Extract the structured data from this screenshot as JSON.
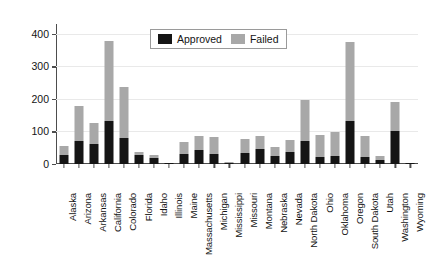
{
  "chart_data": {
    "type": "bar",
    "subtype": "stacked-vertical",
    "title": "",
    "xlabel": "",
    "ylabel": "Number of initiatives",
    "ylim": [
      0,
      430
    ],
    "yticks": [
      0,
      100,
      200,
      300,
      400
    ],
    "ytick_labels": [
      "0",
      "100",
      "200",
      "300",
      "400"
    ],
    "grid": true,
    "grid_axis": "y",
    "legend_position": "upper center",
    "categories": [
      "Alaska",
      "Arizona",
      "Arkansas",
      "California",
      "Colorado",
      "Florida",
      "Idaho",
      "Illinois",
      "Maine",
      "Massachusetts",
      "Michigan",
      "Mississippi",
      "Missouri",
      "Montana",
      "Nebraska",
      "Nevada",
      "North Dakota",
      "Ohio",
      "Oklahoma",
      "Oregon",
      "South Dakota",
      "Utah",
      "Washington",
      "Wyoming"
    ],
    "series": [
      {
        "name": "Approved",
        "color": "#151515",
        "values": [
          29,
          71,
          60,
          132,
          81,
          29,
          17,
          2,
          30,
          43,
          31,
          4,
          34,
          45,
          24,
          36,
          70,
          21,
          26,
          132,
          21,
          13,
          100,
          3
        ]
      },
      {
        "name": "Failed",
        "color": "#a8a8a8",
        "values": [
          26,
          106,
          67,
          247,
          155,
          9,
          12,
          0,
          37,
          42,
          51,
          1,
          43,
          40,
          29,
          38,
          127,
          68,
          73,
          243,
          65,
          12,
          90,
          0
        ]
      }
    ],
    "totals": [
      55,
      177,
      127,
      379,
      236,
      38,
      29,
      2,
      67,
      85,
      82,
      5,
      77,
      85,
      53,
      74,
      197,
      89,
      99,
      375,
      86,
      25,
      190,
      3
    ]
  },
  "legend": {
    "entries": [
      {
        "label": "Approved",
        "swatch": "legend-swatch-approved"
      },
      {
        "label": "Failed",
        "swatch": "legend-swatch-failed"
      }
    ]
  }
}
